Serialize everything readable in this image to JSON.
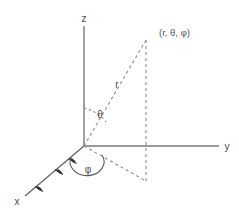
{
  "figure": {
    "type": "spherical-coordinate-diagram",
    "title": "",
    "background_color": "#ffffff",
    "line_color": "#7a7a7a",
    "dashed_color": "#8a8a8a",
    "text_color": "#4a4a4a"
  },
  "axes": {
    "z": {
      "label": "z",
      "label_x": 84,
      "label_y": 20,
      "start": {
        "x": 84,
        "y": 26
      },
      "end": {
        "x": 84,
        "y": 146
      },
      "style": "solid"
    },
    "y": {
      "label": "y",
      "label_x": 227,
      "label_y": 149,
      "start": {
        "x": 84,
        "y": 146
      },
      "end": {
        "x": 219,
        "y": 146
      },
      "style": "solid"
    },
    "x": {
      "label": "x",
      "label_x": 17,
      "label_y": 202,
      "start": {
        "x": 84,
        "y": 146
      },
      "end": {
        "x": 25,
        "y": 196
      },
      "style": "solid-with-ticks",
      "ticks": 3
    }
  },
  "origin": {
    "x": 84,
    "y": 146
  },
  "point": {
    "label": "(r, θ, φ)",
    "label_x": 159,
    "label_y": 33,
    "x": 146,
    "y": 40
  },
  "projection_point": {
    "x": 146,
    "y": 181
  },
  "radial_line": {
    "label": "r",
    "label_x": 117,
    "label_y": 85,
    "style": "dashed",
    "from": {
      "x": 84,
      "y": 146
    },
    "to": {
      "x": 146,
      "y": 40
    }
  },
  "vertical_drop_line": {
    "style": "dashed",
    "from": {
      "x": 146,
      "y": 40
    },
    "to": {
      "x": 146,
      "y": 181
    }
  },
  "ground_projection_line": {
    "style": "dashed",
    "from": {
      "x": 84,
      "y": 146
    },
    "to": {
      "x": 146,
      "y": 181
    }
  },
  "angles": {
    "theta": {
      "label": "θ",
      "label_x": 100,
      "label_y": 114,
      "arc_style": "dashed",
      "between": [
        "z-axis",
        "radial-line"
      ]
    },
    "phi": {
      "label": "φ",
      "label_x": 88,
      "label_y": 169,
      "arc_style": "solid",
      "between": [
        "x-axis",
        "ground-projection-line"
      ]
    }
  }
}
